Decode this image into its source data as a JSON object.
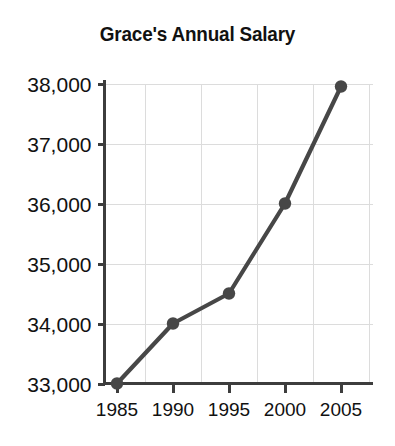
{
  "chart_data": {
    "type": "line",
    "title": "Grace's Annual Salary",
    "xlabel": "",
    "ylabel": "",
    "x": [
      1985,
      1990,
      1995,
      2000,
      2005
    ],
    "categories": [
      "1985",
      "1990",
      "1995",
      "2000",
      "2005"
    ],
    "values": [
      33000,
      34000,
      34500,
      36000,
      37950
    ],
    "value_labels": [
      "33,000",
      "34,000",
      "34,500",
      "36,000",
      "37,950"
    ],
    "series": [
      {
        "name": "Annual Salary",
        "values": [
          33000,
          34000,
          34500,
          36000,
          37950
        ]
      }
    ],
    "xlim": [
      1983.0,
      1008.0
    ],
    "ylim": [
      33000,
      38000
    ],
    "ytick_values": [
      33000,
      34000,
      35000,
      36000,
      37000,
      38000
    ],
    "ytick_labels": [
      "33,000",
      "34,000",
      "35,000",
      "36,000",
      "37,000",
      "38,000"
    ],
    "xtick_values": [
      1985,
      1990,
      1995,
      2000,
      2005
    ],
    "xtick_labels": [
      "1985",
      "1990",
      "1995",
      "2000",
      "2005"
    ],
    "grid": true,
    "grid_axis": "both",
    "legend": false,
    "legend_position": "none",
    "colors": {
      "line": "#474747",
      "marker": "#474747",
      "grid": "#dcdcdc",
      "axis": "#3d3d3d",
      "text": "#111111",
      "background": "#ffffff"
    },
    "marker_style": "circle",
    "annotations": []
  }
}
